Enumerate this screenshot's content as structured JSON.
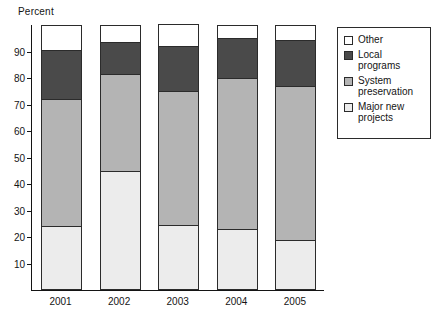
{
  "chart_data": {
    "type": "bar",
    "subtype": "stacked-bar-percent",
    "title": "",
    "ylabel": "Percent",
    "xlabel": "",
    "categories": [
      "2001",
      "2002",
      "2003",
      "2004",
      "2005"
    ],
    "ylim": [
      0,
      100
    ],
    "ytick_values": [
      10,
      20,
      30,
      40,
      50,
      60,
      70,
      80,
      90
    ],
    "ytick_labels": [
      "10",
      "20",
      "30",
      "40",
      "50",
      "60",
      "70",
      "80",
      "90"
    ],
    "grid": false,
    "legend_position": "right",
    "stack_order_bottom_to_top": [
      "Major new projects",
      "System preservation",
      "Local programs",
      "Other"
    ],
    "series": [
      {
        "name": "Major new projects",
        "color": "#ececec",
        "values": [
          24.0,
          45.0,
          24.5,
          23.0,
          19.0
        ]
      },
      {
        "name": "System preservation",
        "color": "#b4b4b4",
        "values": [
          48.0,
          36.5,
          50.5,
          57.0,
          58.0
        ]
      },
      {
        "name": "Local programs",
        "color": "#4a4a4a",
        "values": [
          18.5,
          12.0,
          17.0,
          15.0,
          17.5
        ]
      },
      {
        "name": "Other",
        "color": "#ffffff",
        "values": [
          9.5,
          6.5,
          8.5,
          5.0,
          5.5
        ]
      }
    ],
    "cumulative_tops": {
      "Major new projects": [
        24.0,
        45.0,
        24.5,
        23.0,
        19.0
      ],
      "System preservation": [
        72.0,
        81.5,
        75.0,
        80.0,
        77.0
      ],
      "Local programs": [
        90.5,
        93.5,
        92.0,
        95.0,
        94.5
      ],
      "Other": [
        100,
        100,
        100,
        100,
        100
      ]
    }
  },
  "legend": {
    "items": [
      {
        "label": "Other",
        "color": "#ffffff",
        "name": "legend-item-other"
      },
      {
        "label": "Local\nprograms",
        "color": "#4a4a4a",
        "name": "legend-item-local-programs"
      },
      {
        "label": "System\npreservation",
        "color": "#b4b4b4",
        "name": "legend-item-system-preservation"
      },
      {
        "label": "Major new\nprojects",
        "color": "#ececec",
        "name": "legend-item-major-new-projects"
      }
    ]
  },
  "colors": {
    "axis": "#141414",
    "outline": "#2b2b2b",
    "background": "#ffffff",
    "other": "#ffffff",
    "local_programs": "#4a4a4a",
    "system_preservation": "#b4b4b4",
    "major_new_projects": "#ececec"
  }
}
